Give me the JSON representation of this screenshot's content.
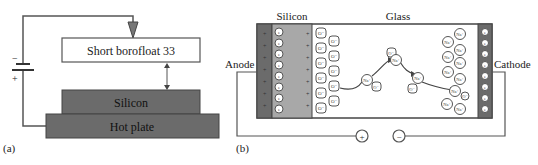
{
  "panel_a": {
    "label": "(a)",
    "glass_label": "Short borofloat 33",
    "silicon_label": "Silicon",
    "hotplate_label": "Hot plate",
    "battery_minus": "−",
    "battery_plus": "+"
  },
  "panel_b": {
    "label": "(b)",
    "silicon_label": "Silicon",
    "glass_label": "Glass",
    "anode_label": "Anode",
    "cathode_label": "Cathode",
    "plus_terminal": "+",
    "minus_terminal": "−",
    "electron_symbol": "e",
    "oxygen_ion": "O⁻",
    "sodium_ion": "Na⁺",
    "positive_charge": "+"
  },
  "colors": {
    "dark_fill": "#6b6b6b",
    "medium_fill": "#9a9a9a",
    "light_fill": "#b5b5b5",
    "line": "#555555"
  }
}
